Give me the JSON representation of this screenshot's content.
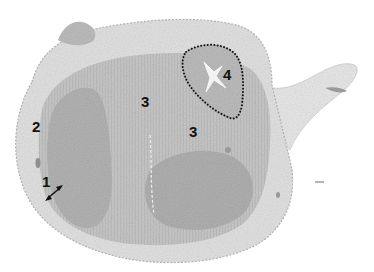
{
  "figure": {
    "kind": "histological-section-micrograph",
    "color_mode": "grayscale",
    "colors": {
      "background": "#ffffff",
      "outer_layer": "#dcdcdc",
      "tissue_mid": "#c2c2c2",
      "tissue_dark": "#a9a9a9",
      "label": "#111111",
      "outline": "#111111"
    },
    "annotations": {
      "label_1": "1",
      "label_2": "2",
      "label_3a": "3",
      "label_3b": "3",
      "label_4": "4"
    },
    "markers": {
      "region_4_outline": "dotted-outline",
      "label_1_indicator": "double-headed-arrow"
    }
  }
}
